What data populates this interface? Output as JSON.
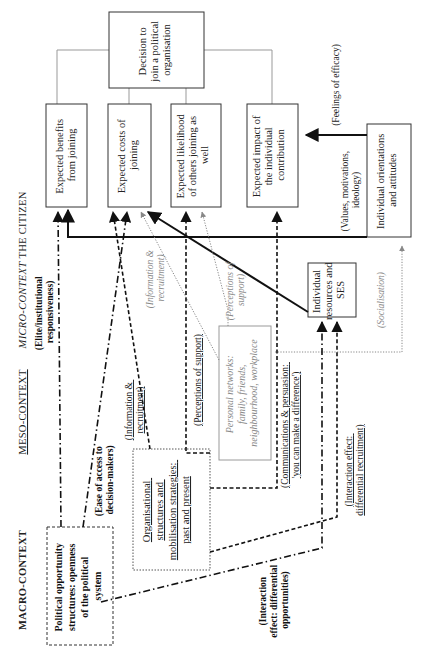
{
  "diagram": {
    "orientation": "rotated-90-ccw",
    "levels": {
      "macro": "MACRO-CONTEXT",
      "meso": "MESO-CONTEXT",
      "micro": "MICRO-CONTEXT",
      "citizen": "THE CITIZEN"
    },
    "nodes": {
      "decision": [
        "Decision to",
        "join a political",
        "organisation"
      ],
      "benefits": [
        "Expected benefits",
        "from joining"
      ],
      "costs": [
        "Expected costs of",
        "joining"
      ],
      "likelihood": [
        "Expected likelihood",
        "of others joining as",
        "well"
      ],
      "impact": [
        "Expected impact of",
        "the individual",
        "contribution"
      ],
      "orientations": [
        "Individual orientations",
        "and attitudes"
      ],
      "resources": [
        "Individual",
        "resources and",
        "SES"
      ],
      "networks": [
        "Personal networks:",
        "family, friends,",
        "neighbourhood, workplace"
      ],
      "organisational": [
        "Organisational",
        "structures and",
        "mobilisation strategies:",
        "past and present"
      ],
      "political": [
        "Political opportunity",
        "structures: openness",
        "of the political",
        "system"
      ]
    },
    "edge_labels": {
      "efficacy": "(Feelings of efficacy)",
      "values": [
        "(Values, motivations,",
        "ideology)"
      ],
      "elite": [
        "(Elite/institutional",
        "responsiveness)"
      ],
      "ease": [
        "(Ease of access to",
        "decision-makers)"
      ],
      "info_meso": [
        "(Information &",
        "recruitment)"
      ],
      "perceptions_meso": "(Perceptions of support)",
      "info_micro": [
        "(Information &",
        "recruitment)"
      ],
      "perceptions_micro": [
        "(Perceptions of",
        "support)"
      ],
      "communications": [
        "(Communications & persuasion:",
        "'you can make a difference')"
      ],
      "interaction_recruit": [
        "(Interaction effect:",
        "differential recruitment)"
      ],
      "interaction_opps": [
        "(Interaction",
        "effect: differential",
        "opportunities)"
      ],
      "socialisation": "(Socialisation)"
    },
    "line_styles": {
      "solid": "#111111",
      "dash_dot": "#111111",
      "dashed": "#111111",
      "dotted_grey": "#888888",
      "connector_grey": "#999999"
    }
  }
}
